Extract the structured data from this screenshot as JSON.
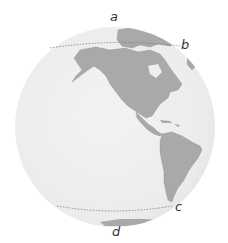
{
  "figure": {
    "colors": {
      "ocean": "#efefef",
      "land": "#a9a9a9",
      "land_edge": "#8e8e8e",
      "dashed_line": "#777777",
      "label": "#333333"
    },
    "labels": {
      "a": "a",
      "b": "b",
      "c": "c",
      "d": "d"
    },
    "lines": [
      {
        "name": "northern-latitude-line",
        "from": "a",
        "to": "b",
        "style": "dotted"
      },
      {
        "name": "southern-latitude-line",
        "from": "d",
        "to": "c",
        "style": "dotted"
      }
    ]
  }
}
